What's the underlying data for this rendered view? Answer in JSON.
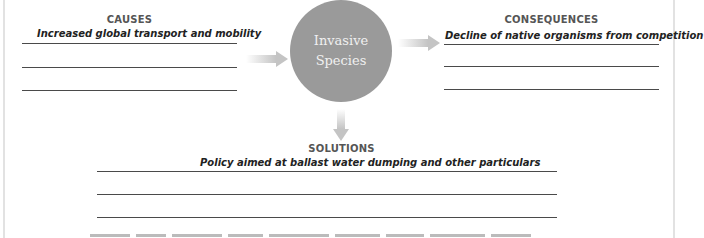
{
  "center": {
    "line1": "Invasive",
    "line2": "Species"
  },
  "causes": {
    "title": "CAUSES",
    "answers": [
      "Increased global transport and mobility",
      "",
      ""
    ]
  },
  "consequences": {
    "title": "CONSEQUENCES",
    "answers": [
      "Decline of native organisms from competition",
      "",
      ""
    ]
  },
  "solutions": {
    "title": "SOLUTIONS",
    "answers": [
      "Policy aimed at ballast water dumping and other particulars",
      "",
      ""
    ]
  },
  "colors": {
    "circle": "#9a9a9a",
    "arrow": "#c8c8c8",
    "title": "#555555",
    "line": "#4a4a4a"
  }
}
